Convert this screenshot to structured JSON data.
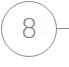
{
  "diagram": {
    "node": {
      "label": "8",
      "shape": "circle",
      "stroke_color": "#8a8a8a",
      "text_color": "#7a7a7a"
    },
    "connector": {
      "direction": "right",
      "color": "#8a8a8a"
    }
  }
}
